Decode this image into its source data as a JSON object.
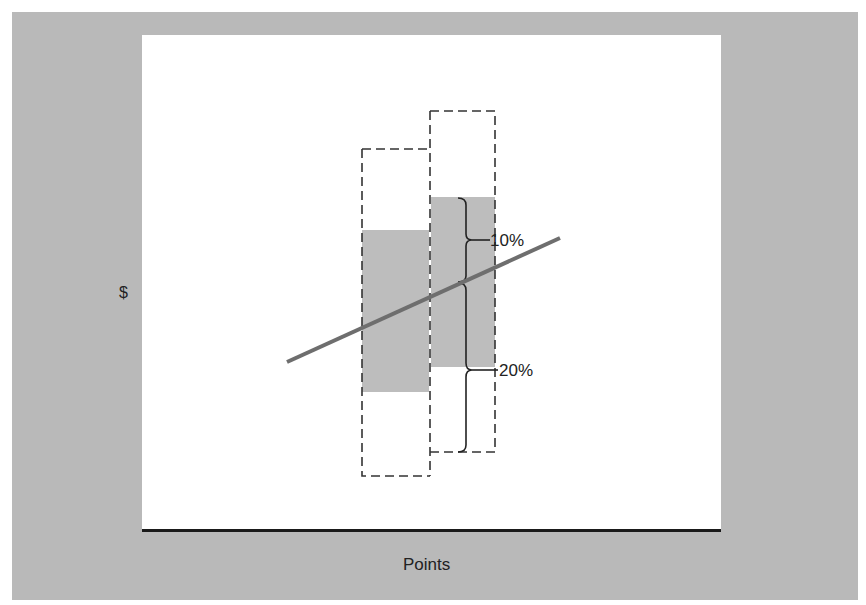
{
  "figure": {
    "y_axis_label": "$",
    "x_axis_label": "Points",
    "annotations": [
      {
        "label": "10%",
        "describes": "upper brace spread above the line"
      },
      {
        "label": "20%",
        "describes": "lower brace spread below the line"
      }
    ],
    "colors": {
      "background": "#b9b9b9",
      "panel": "#ffffff",
      "range_fill": "#bdbdbd",
      "trend_line": "#6e6e6e",
      "dashed_outline": "#333333",
      "axis": "#1a1a1a"
    },
    "elements": {
      "left_range_box": {
        "outline": "dashed",
        "fill_band": "gray"
      },
      "right_range_box": {
        "outline": "dashed",
        "fill_band": "gray"
      },
      "trend_line": {
        "style": "solid",
        "direction": "rising"
      }
    }
  }
}
